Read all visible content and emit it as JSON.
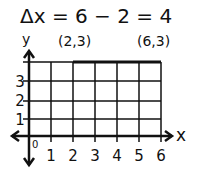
{
  "equation": "Δx = 6 − 2 = 4",
  "axes": {
    "x_label": "x",
    "y_label": "y",
    "origin_label": "0"
  },
  "x_ticks": [
    "1",
    "2",
    "3",
    "4",
    "5",
    "6"
  ],
  "y_ticks": [
    "1",
    "2",
    "3"
  ],
  "points": [
    {
      "label": "(2,3)",
      "x": 2,
      "y": 3
    },
    {
      "label": "(6,3)",
      "x": 6,
      "y": 3
    }
  ],
  "segment": {
    "from": [
      2,
      3
    ],
    "to": [
      6,
      3
    ],
    "length": 4
  },
  "colors": {
    "ink": "#111111",
    "background": "#ffffff"
  }
}
